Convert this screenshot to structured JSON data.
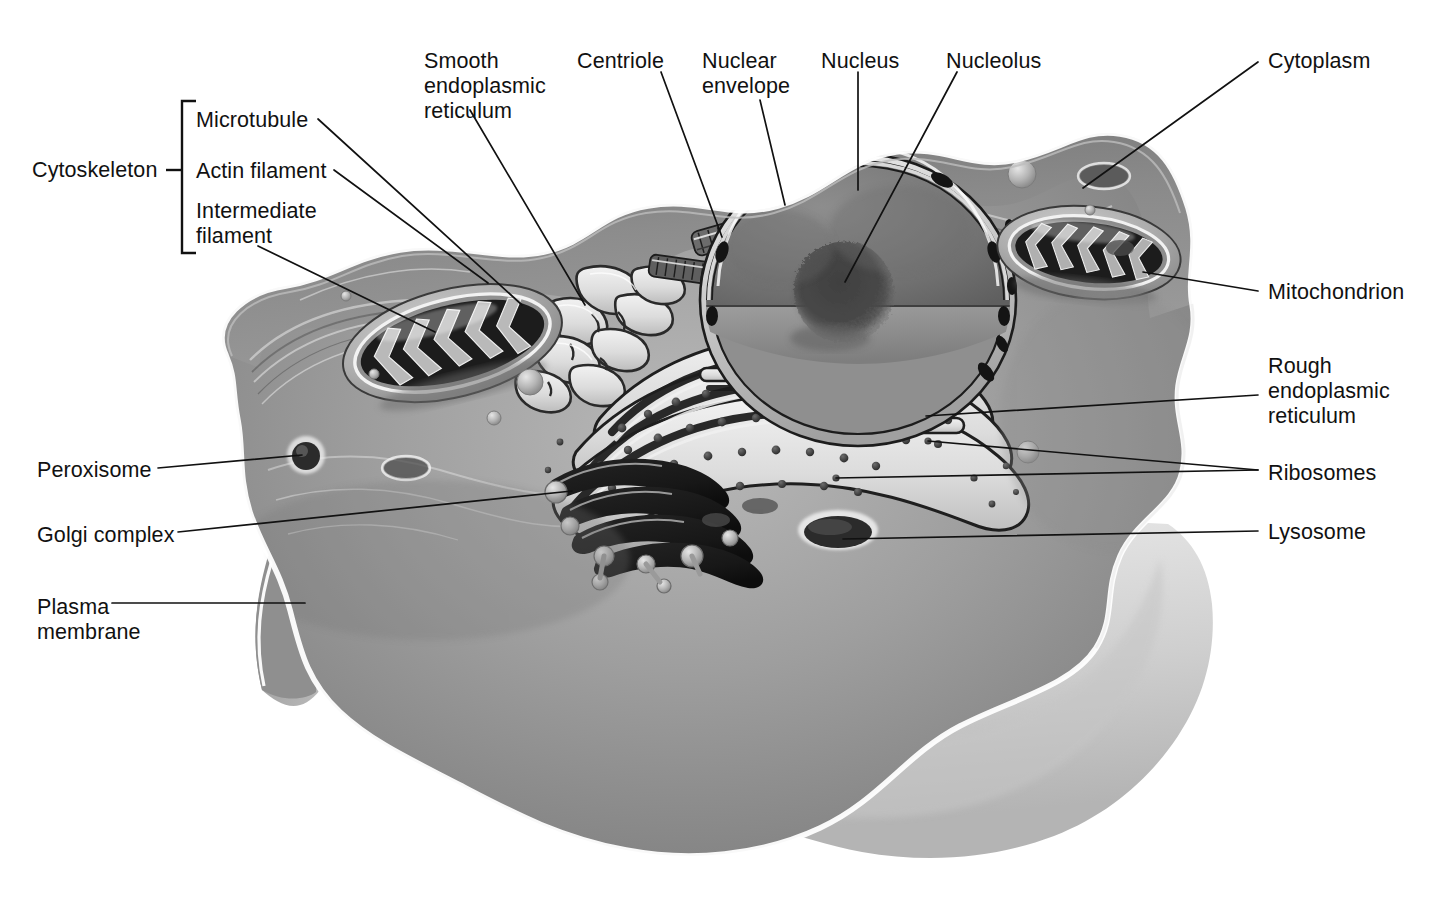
{
  "diagram": {
    "style": "grayscale airbrush illustration",
    "background_color": "#ffffff",
    "ink_color": "#111111"
  },
  "groups": [
    {
      "name": "Cytoskeleton",
      "members": [
        "Microtubule",
        "Actin filament",
        "Intermediate filament"
      ]
    }
  ],
  "labels": {
    "cytoskeleton": {
      "text": "Cytoskeleton",
      "x": 32,
      "y": 158
    },
    "microtubule": {
      "text": "Microtubule",
      "x": 196,
      "y": 108
    },
    "actin_filament": {
      "text": "Actin filament",
      "x": 196,
      "y": 159
    },
    "intermediate_filament": {
      "text": "Intermediate\nfilament",
      "x": 196,
      "y": 199
    },
    "smooth_er": {
      "text": "Smooth\nendoplasmic\nreticulum",
      "x": 424,
      "y": 49
    },
    "centriole": {
      "text": "Centriole",
      "x": 577,
      "y": 49
    },
    "nuclear_envelope": {
      "text": "Nuclear\nenvelope",
      "x": 702,
      "y": 49
    },
    "nucleus": {
      "text": "Nucleus",
      "x": 821,
      "y": 49
    },
    "nucleolus": {
      "text": "Nucleolus",
      "x": 946,
      "y": 49
    },
    "cytoplasm": {
      "text": "Cytoplasm",
      "x": 1268,
      "y": 49
    },
    "mitochondrion": {
      "text": "Mitochondrion",
      "x": 1268,
      "y": 280
    },
    "rough_er": {
      "text": "Rough\nendoplasmic\nreticulum",
      "x": 1268,
      "y": 354
    },
    "ribosomes": {
      "text": "Ribosomes",
      "x": 1268,
      "y": 461
    },
    "lysosome": {
      "text": "Lysosome",
      "x": 1268,
      "y": 520
    },
    "peroxisome": {
      "text": "Peroxisome",
      "x": 37,
      "y": 458
    },
    "golgi_complex": {
      "text": "Golgi complex",
      "x": 37,
      "y": 523
    },
    "plasma_membrane": {
      "text": "Plasma\nmembrane",
      "x": 37,
      "y": 595
    }
  },
  "leaders": [
    {
      "name": "microtubule-leader",
      "points": "318,119 522,305"
    },
    {
      "name": "actin-filament-leader",
      "points": "334,170 488,283"
    },
    {
      "name": "intermediate-filament-leader",
      "points": "258,246 435,332"
    },
    {
      "name": "smooth-er-leader",
      "points": "470,110 585,305"
    },
    {
      "name": "centriole-leader",
      "points": "661,72 722,237"
    },
    {
      "name": "nuclear-envelope-leader",
      "points": "760,100 785,205"
    },
    {
      "name": "nucleus-leader",
      "points": "858,72 858,190"
    },
    {
      "name": "nucleolus-leader",
      "points": "957,72 845,282"
    },
    {
      "name": "cytoplasm-leader",
      "points": "1258,62 1083,188"
    },
    {
      "name": "mitochondrion-leader",
      "points": "1258,291 1143,272"
    },
    {
      "name": "rough-er-leader",
      "points": "1258,395 926,416"
    },
    {
      "name": "ribosomes-leader-a",
      "points": "1258,470 928,441"
    },
    {
      "name": "ribosomes-leader-b",
      "points": "1258,470 836,478"
    },
    {
      "name": "lysosome-leader",
      "points": "1258,531 843,539"
    },
    {
      "name": "peroxisome-leader",
      "points": "158,468 302,455"
    },
    {
      "name": "golgi-complex-leader",
      "points": "178,532 572,491"
    },
    {
      "name": "plasma-membrane-leader",
      "points": "112,603 305,603"
    }
  ],
  "bracket": {
    "name": "cytoskeleton-bracket",
    "x": 182,
    "y_top": 101,
    "y_bottom": 253,
    "tick_x": 166,
    "tick_y": 170
  },
  "organelles": [
    {
      "name": "plasma-membrane",
      "description": "wavy outer boundary with white highlight rim enclosing the cell"
    },
    {
      "name": "cytoplasm",
      "description": "mid-gray cytosol filling the cell interior"
    },
    {
      "name": "nucleus",
      "description": "large cut-away sphere, dark nucleoplasm, flat sectioned face"
    },
    {
      "name": "nucleolus",
      "description": "dark irregular fuzzy mass inside nucleus"
    },
    {
      "name": "nuclear-envelope",
      "description": "double membrane ring around nucleus with dark nuclear pores"
    },
    {
      "name": "centriole",
      "description": "pair of short cylindrical barrels near the nucleus"
    },
    {
      "name": "rough-er",
      "description": "concentric flattened cisternae studded with ribosome granules"
    },
    {
      "name": "smooth-er",
      "description": "branching tubular network left of the nucleus"
    },
    {
      "name": "ribosomes",
      "description": "small dark dots on rough ER membranes and free in cytosol"
    },
    {
      "name": "golgi-complex",
      "description": "stack of curved dark flattened sacs with budding vesicles"
    },
    {
      "name": "mitochondrion-left",
      "description": "oval organelle with folded cristae, left side of cell"
    },
    {
      "name": "mitochondrion-right",
      "description": "oval organelle with folded cristae, upper right of cell"
    },
    {
      "name": "lysosome",
      "description": "dark oval vesicle near lower right membrane"
    },
    {
      "name": "peroxisome",
      "description": "small dark round vesicle near left membrane"
    },
    {
      "name": "microtubule",
      "description": "filament bundle in cortical cytoplasm, upper left"
    },
    {
      "name": "actin-filament",
      "description": "fine filament meshwork beneath plasma membrane"
    },
    {
      "name": "intermediate-filament",
      "description": "filament strands in the left cortical region"
    }
  ]
}
